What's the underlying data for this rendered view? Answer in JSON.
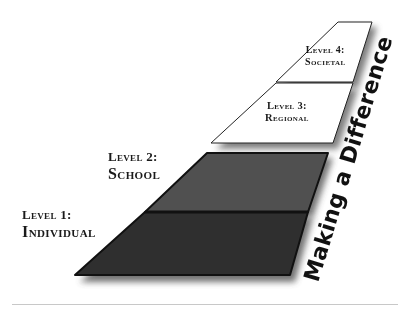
{
  "diagram": {
    "title": "Making a Difference",
    "levels": [
      {
        "number_label": "Level 1:",
        "name": "Individual",
        "fill": "#2f2f2f"
      },
      {
        "number_label": "Level 2:",
        "name": "School",
        "fill": "#4f4f4f"
      },
      {
        "number_label": "Level 3:",
        "name": "Regional",
        "fill": "#ffffff"
      },
      {
        "number_label": "Level 4:",
        "name": "Societal",
        "fill": "#ffffff"
      }
    ],
    "colors": {
      "outline": "#111111",
      "shadow": "#555555",
      "title_text": "#111111",
      "rule": "#c8c8c8"
    }
  }
}
